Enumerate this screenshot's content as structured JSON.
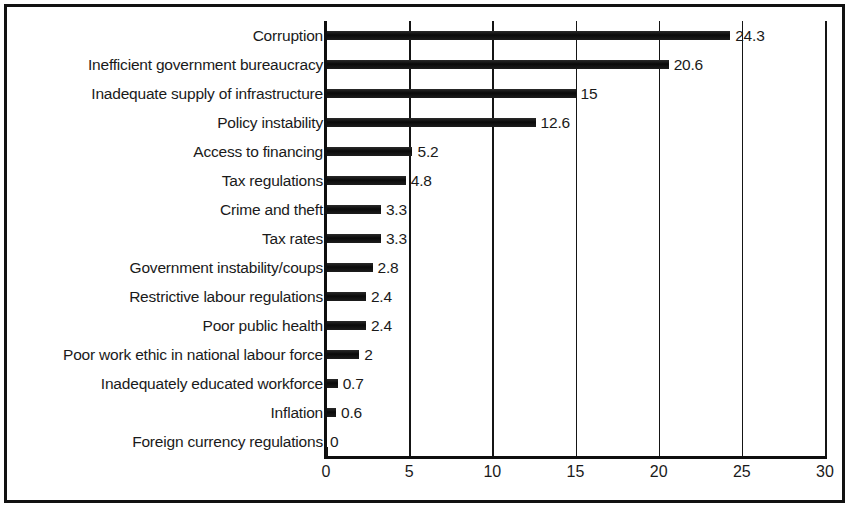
{
  "chart_data": {
    "type": "bar",
    "orientation": "horizontal",
    "title": "",
    "subtitle": "",
    "xlabel": "",
    "ylabel": "",
    "xlim": [
      0,
      30
    ],
    "xticks": [
      "0",
      "5",
      "10",
      "15",
      "20",
      "25",
      "30"
    ],
    "xtick_values": [
      0,
      5,
      10,
      15,
      20,
      25,
      30
    ],
    "grid": "vertical",
    "legend": "none",
    "bar_color": "#121212",
    "categories": [
      "Corruption",
      "Inefficient government bureaucracy",
      "Inadequate supply of infrastructure",
      "Policy instability",
      "Access to financing",
      "Tax regulations",
      "Crime and theft",
      "Tax rates",
      "Government instability/coups",
      "Restrictive labour regulations",
      "Poor public health",
      "Poor work ethic in national labour force",
      "Inadequately educated workforce",
      "Inflation",
      "Foreign currency regulations"
    ],
    "values": [
      24.3,
      20.6,
      15,
      12.6,
      5.2,
      4.8,
      3.3,
      3.3,
      2.8,
      2.4,
      2.4,
      2,
      0.7,
      0.6,
      0
    ],
    "value_labels": [
      "24.3",
      "20.6",
      "15",
      "12.6",
      "5.2",
      "4.8",
      "3.3",
      "3.3",
      "2.8",
      "2.4",
      "2.4",
      "2",
      "0.7",
      "0.6",
      "0"
    ]
  }
}
